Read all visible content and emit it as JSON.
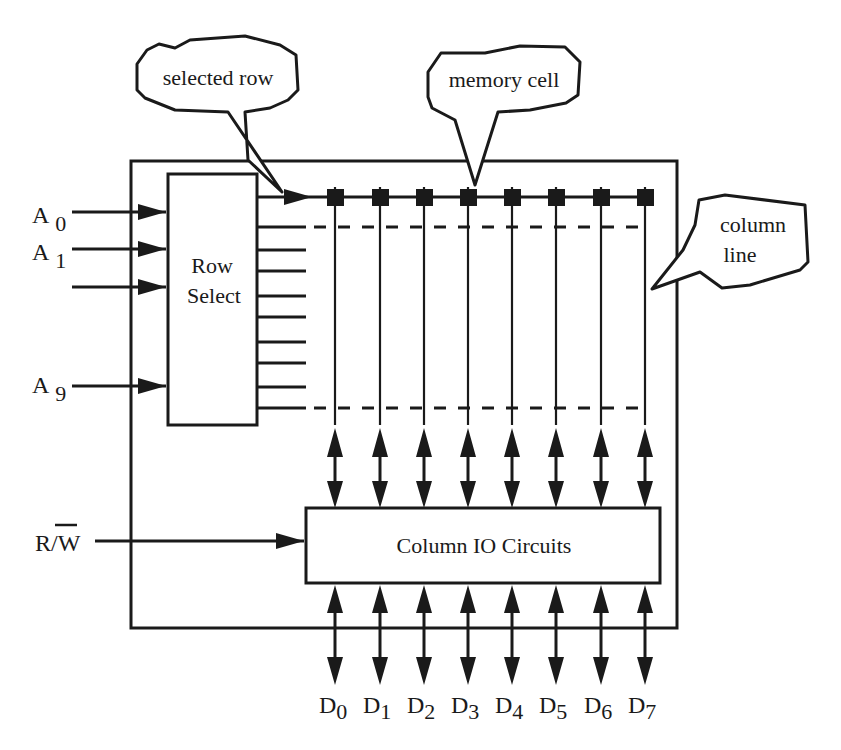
{
  "diagram": {
    "callouts": {
      "selected_row": "selected row",
      "memory_cell": "memory cell",
      "column_line_1": "column",
      "column_line_2": "line"
    },
    "blocks": {
      "row_select_1": "Row",
      "row_select_2": "Select",
      "column_io": "Column IO Circuits"
    },
    "address_inputs": [
      {
        "letter": "A",
        "sub": "0"
      },
      {
        "letter": "A",
        "sub": "1"
      },
      {
        "letter": "",
        "sub": ""
      },
      {
        "letter": "A",
        "sub": "9"
      }
    ],
    "rw_signal": {
      "r": "R/",
      "w": "W"
    },
    "data_lines": [
      {
        "letter": "D",
        "sub": "0"
      },
      {
        "letter": "D",
        "sub": "1"
      },
      {
        "letter": "D",
        "sub": "2"
      },
      {
        "letter": "D",
        "sub": "3"
      },
      {
        "letter": "D",
        "sub": "4"
      },
      {
        "letter": "D",
        "sub": "5"
      },
      {
        "letter": "D",
        "sub": "6"
      },
      {
        "letter": "D",
        "sub": "7"
      }
    ],
    "columns": 8,
    "row_lines": 10
  }
}
